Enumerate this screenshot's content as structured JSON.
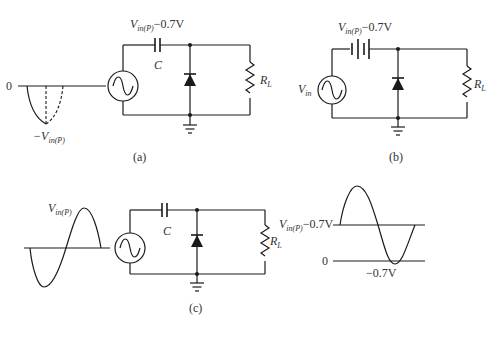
{
  "figure": {
    "a": {
      "caption": "(a)",
      "zero_label": "0",
      "peak_label_main": "−V",
      "peak_label_sub": "in(P)",
      "cap_voltage_main": "V",
      "cap_voltage_sub": "in(P)",
      "cap_voltage_tail": "−0.7V",
      "capacitor_label": "C",
      "resistor_label_main": "R",
      "resistor_label_sub": "L"
    },
    "b": {
      "caption": "(b)",
      "source_label_main": "V",
      "source_label_sub": "in",
      "battery_voltage_main": "V",
      "battery_voltage_sub": "in(P)",
      "battery_voltage_tail": "−0.7V",
      "resistor_label_main": "R",
      "resistor_label_sub": "L"
    },
    "c": {
      "caption": "(c)",
      "input_peak_main": "V",
      "input_peak_sub": "in(P)",
      "capacitor_label": "C",
      "resistor_label_main": "R",
      "resistor_label_sub": "L",
      "output_level_main": "V",
      "output_level_sub": "in(P)",
      "output_level_tail": "−0.7V",
      "output_zero_label": "0",
      "output_min_label": "−0.7V"
    }
  },
  "icons": [
    "ac-source-icon",
    "diode-icon",
    "ground-icon",
    "capacitor-icon",
    "resistor-icon",
    "battery-icon"
  ]
}
